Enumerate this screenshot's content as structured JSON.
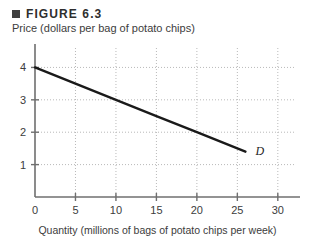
{
  "figure": {
    "bullet_icon": "square-bullet-icon",
    "title": "FIGURE 6.3"
  },
  "chart_data": {
    "type": "line",
    "title": "FIGURE 6.3",
    "xlabel": "Quantity (millions of bags of potato chips per week)",
    "ylabel": "Price (dollars per bag of potato chips)",
    "xlim": [
      0,
      32
    ],
    "ylim": [
      0,
      4.6
    ],
    "grid": true,
    "legend": "none",
    "xticks": [
      0,
      5,
      10,
      15,
      20,
      25,
      30
    ],
    "xtick_labels": [
      "0",
      "5",
      "10",
      "15",
      "20",
      "25",
      "30"
    ],
    "yticks": [
      1,
      2,
      3,
      4
    ],
    "ytick_labels": [
      "1",
      "2",
      "3",
      "4"
    ],
    "origin_label": "0",
    "series": [
      {
        "name": "D",
        "label": "D",
        "annotation": "D",
        "x": [
          0,
          5,
          10,
          15,
          20,
          26
        ],
        "values": [
          4.0,
          3.5,
          3.0,
          2.5,
          2.0,
          1.4
        ]
      }
    ],
    "curve_color": "#1a1a1a",
    "grid_color": "#b9b9b9",
    "axis_color": "#6f6f6f"
  }
}
